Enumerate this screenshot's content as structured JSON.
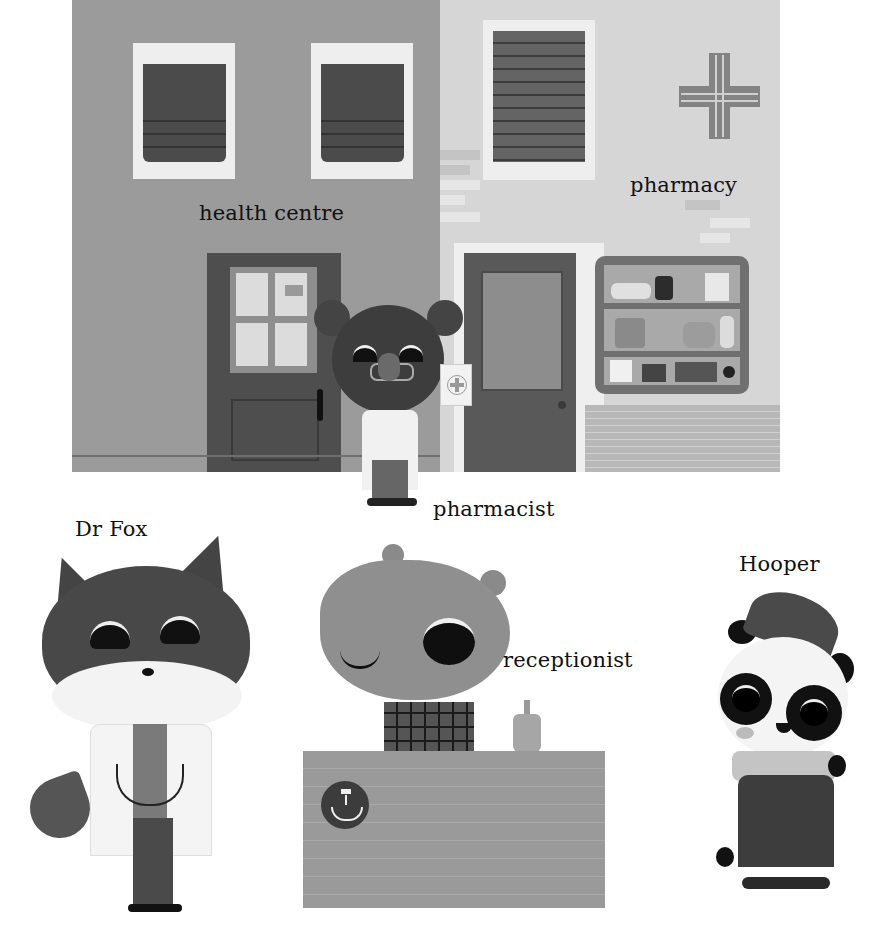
{
  "scene": {
    "building_labels": {
      "health_centre": "health centre",
      "pharmacy": "pharmacy"
    },
    "pharmacy_sign_icon": "cross-icon"
  },
  "characters": [
    {
      "name": "pharmacist",
      "label": "pharmacist",
      "animal": "bear"
    },
    {
      "name": "dr-fox",
      "label": "Dr Fox",
      "animal": "fox"
    },
    {
      "name": "receptionist",
      "label": "receptionist",
      "animal": "rhino"
    },
    {
      "name": "hooper",
      "label": "Hooper",
      "animal": "panda"
    }
  ],
  "desk_sign_icon": "hand-washing-icon",
  "colors": {
    "health_wall": "#9b9b9b",
    "pharmacy_wall": "#d6d6d6",
    "blind": "#4b4b4b",
    "door": "#555555",
    "text": "#111111"
  }
}
